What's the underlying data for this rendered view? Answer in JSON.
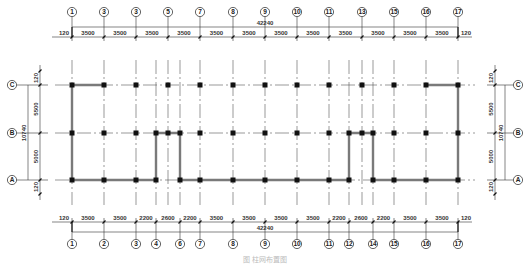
{
  "drawing": {
    "title_caption": "图  柱网布置图",
    "colors": {
      "line": "#333333",
      "wall": "#7a7a7a",
      "column": "#111111",
      "axis_dash": "#555555",
      "background": "#ffffff"
    }
  },
  "top_axes": {
    "labels": [
      "1",
      "3",
      "3",
      "5",
      "7",
      "8",
      "9",
      "10",
      "11",
      "13",
      "15",
      "16",
      "17"
    ],
    "x": [
      72,
      104,
      136,
      168,
      200,
      233,
      265,
      297,
      329,
      362,
      394,
      426,
      458
    ],
    "segments": [
      "120",
      "3500",
      "3500",
      "3500",
      "3500",
      "3500",
      "3500",
      "3500",
      "3500",
      "3500",
      "3500",
      "3500",
      "3500",
      "120"
    ],
    "total": "42240"
  },
  "bottom_axes": {
    "labels": [
      "1",
      "2",
      "3",
      "4",
      "6",
      "7",
      "8",
      "9",
      "10",
      "11",
      "12",
      "14",
      "15",
      "16",
      "17"
    ],
    "x": [
      72,
      104,
      136,
      156,
      180,
      200,
      233,
      265,
      297,
      329,
      349,
      373,
      394,
      426,
      458
    ],
    "segments": [
      "120",
      "3500",
      "3500",
      "2200",
      "2600",
      "2200",
      "3500",
      "3500",
      "3500",
      "3500",
      "2200",
      "2600",
      "2200",
      "3500",
      "3500",
      "120"
    ],
    "total": "42240"
  },
  "rows": {
    "labels": [
      "C",
      "B",
      "A"
    ],
    "y": [
      85,
      133,
      180
    ],
    "segments": [
      "120",
      "5500",
      "5000",
      "120"
    ],
    "total": "10740"
  }
}
